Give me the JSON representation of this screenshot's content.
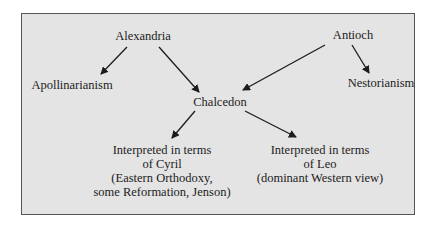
{
  "nodes": {
    "alexandria": "Alexandria",
    "antioch": "Antioch",
    "apollinarianism": "Apollinarianism",
    "nestorianism": "Nestorianism",
    "chalcedon": "Chalcedon",
    "cyril": {
      "line1": "Interpreted in terms",
      "line2": "of Cyril",
      "line3": "(Eastern Orthodoxy,",
      "line4": "some Reformation, Jenson)"
    },
    "leo": {
      "line1": "Interpreted in terms",
      "line2": "of Leo",
      "line3": "(dominant Western view)"
    }
  },
  "edges": [
    {
      "from": "Alexandria",
      "to": "Apollinarianism"
    },
    {
      "from": "Alexandria",
      "to": "Chalcedon"
    },
    {
      "from": "Antioch",
      "to": "Chalcedon"
    },
    {
      "from": "Antioch",
      "to": "Nestorianism"
    },
    {
      "from": "Chalcedon",
      "to": "Interpreted in terms of Cyril"
    },
    {
      "from": "Chalcedon",
      "to": "Interpreted in terms of Leo"
    }
  ],
  "colors": {
    "background": "#e4e4e4",
    "border": "#555555",
    "text": "#1c1c1c"
  }
}
